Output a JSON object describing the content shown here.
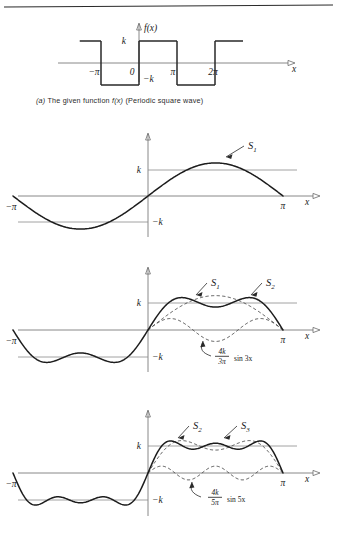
{
  "figure": {
    "background": "#ffffff",
    "ink": "#1a1a1a",
    "top_rule": true
  },
  "caption": {
    "prefix": "(a)",
    "text_before_fx": " The given function ",
    "fx": "f(x)",
    "text_after_fx": " (Periodic square wave)"
  },
  "labels": {
    "x_axis": "x",
    "fx": "f(x)",
    "k": "k",
    "neg_k": "−k",
    "neg_pi": "−π",
    "zero": "0",
    "pi": "π",
    "two_pi": "2π",
    "S1": "S",
    "S1_sub": "1",
    "S2": "S",
    "S2_sub": "2",
    "S3": "S",
    "S3_sub": "3"
  },
  "harmonic_labels": {
    "third": {
      "num": "4k",
      "den": "3π",
      "rest": "sin 3x"
    },
    "fifth": {
      "num": "4k",
      "den": "5π",
      "rest": "sin 5x"
    }
  },
  "chart_data": [
    {
      "id": "panel-a",
      "type": "line",
      "title": "(a) The given function f(x) (Periodic square wave)",
      "xlabel": "x",
      "ylabel": "f(x)",
      "xlim": [
        -4.9,
        8.6
      ],
      "ylim": [
        -1.9,
        1.9
      ],
      "xticks": [
        -3.14159,
        0,
        3.14159,
        6.28319
      ],
      "xticklabels": [
        "−π",
        "0",
        "π",
        "2π"
      ],
      "yticks": [
        1,
        -1
      ],
      "yticklabels": [
        "k",
        "−k"
      ],
      "grid": false,
      "legend": "none",
      "series": [
        {
          "name": "f(x) square wave",
          "style": "solid",
          "description": "Periodic square wave of period 2pi, amplitude k: value -k on (-pi,0), +k on (0,pi), -k on (pi,2pi), +k on (2pi,3pi)",
          "segments": [
            {
              "x": [
                -4.9,
                -3.14159
              ],
              "y": [
                1,
                1
              ]
            },
            {
              "x": [
                -3.14159,
                -3.14159
              ],
              "y": [
                1,
                -1
              ]
            },
            {
              "x": [
                -3.14159,
                0
              ],
              "y": [
                -1,
                -1
              ]
            },
            {
              "x": [
                0,
                0
              ],
              "y": [
                -1,
                1
              ]
            },
            {
              "x": [
                0,
                3.14159
              ],
              "y": [
                1,
                1
              ]
            },
            {
              "x": [
                3.14159,
                3.14159
              ],
              "y": [
                1,
                -1
              ]
            },
            {
              "x": [
                3.14159,
                6.28319
              ],
              "y": [
                -1,
                -1
              ]
            },
            {
              "x": [
                6.28319,
                6.28319
              ],
              "y": [
                -1,
                1
              ]
            },
            {
              "x": [
                6.28319,
                8.6
              ],
              "y": [
                1,
                1
              ]
            }
          ]
        }
      ]
    },
    {
      "id": "panel-b",
      "type": "line",
      "title": "First partial sum S1",
      "xlabel": "x",
      "ylabel": "",
      "xlim": [
        -3.14159,
        3.14159
      ],
      "ylim": [
        -1.55,
        1.55
      ],
      "xticks": [
        -3.14159,
        3.14159
      ],
      "xticklabels": [
        "−π",
        "π"
      ],
      "yticks": [
        1,
        -1
      ],
      "yticklabels": [
        "k",
        "−k"
      ],
      "grid": false,
      "legend": "annotation",
      "annotations": [
        {
          "text": "S1",
          "points_to": "S1 curve near x=1.9"
        }
      ],
      "series": [
        {
          "name": "S1",
          "style": "solid",
          "formula": "(4k/pi) sin x",
          "amplitude": 1.2732,
          "harmonics": [
            {
              "n": 1,
              "coef": 1.2732
            }
          ]
        }
      ]
    },
    {
      "id": "panel-c",
      "type": "line",
      "title": "Partial sums S1 and S2 with third harmonic",
      "xlabel": "x",
      "ylabel": "",
      "xlim": [
        -3.14159,
        3.14159
      ],
      "ylim": [
        -1.55,
        1.55
      ],
      "xticks": [
        -3.14159,
        3.14159
      ],
      "xticklabels": [
        "−π",
        "π"
      ],
      "yticks": [
        1,
        -1
      ],
      "yticklabels": [
        "k",
        "−k"
      ],
      "grid": false,
      "legend": "annotation",
      "annotations": [
        {
          "text": "S1",
          "points_to": "dashed S1 curve"
        },
        {
          "text": "S2",
          "points_to": "solid S2 curve"
        },
        {
          "text": "(4k/3π) sin 3x",
          "points_to": "dashed third-harmonic curve"
        }
      ],
      "series": [
        {
          "name": "S1",
          "style": "dashed",
          "formula": "(4k/pi) sin x",
          "harmonics": [
            {
              "n": 1,
              "coef": 1.2732
            }
          ]
        },
        {
          "name": "S2",
          "style": "solid",
          "formula": "(4k/pi)(sin x + (1/3) sin 3x)",
          "harmonics": [
            {
              "n": 1,
              "coef": 1.2732
            },
            {
              "n": 3,
              "coef": 0.4244
            }
          ]
        },
        {
          "name": "(4k/3π) sin 3x",
          "style": "dashed",
          "formula": "(4k/3pi) sin 3x",
          "harmonics": [
            {
              "n": 3,
              "coef": 0.4244
            }
          ]
        }
      ],
      "left_half_curve": "S2 continued over (-pi, 0)"
    },
    {
      "id": "panel-d",
      "type": "line",
      "title": "Partial sums S2 and S3 with fifth harmonic",
      "xlabel": "x",
      "ylabel": "",
      "xlim": [
        -3.14159,
        3.14159
      ],
      "ylim": [
        -1.55,
        1.55
      ],
      "xticks": [
        -3.14159,
        3.14159
      ],
      "xticklabels": [
        "−π",
        "π"
      ],
      "yticks": [
        1,
        -1
      ],
      "yticklabels": [
        "k",
        "−k"
      ],
      "grid": false,
      "legend": "annotation",
      "annotations": [
        {
          "text": "S2",
          "points_to": "dashed S2 curve"
        },
        {
          "text": "S3",
          "points_to": "solid S3 curve"
        },
        {
          "text": "(4k/5π) sin 5x",
          "points_to": "dashed fifth-harmonic curve"
        }
      ],
      "series": [
        {
          "name": "S2",
          "style": "dashed",
          "formula": "(4k/pi)(sin x + (1/3) sin 3x)",
          "harmonics": [
            {
              "n": 1,
              "coef": 1.2732
            },
            {
              "n": 3,
              "coef": 0.4244
            }
          ]
        },
        {
          "name": "S3",
          "style": "solid",
          "formula": "(4k/pi)(sin x + (1/3) sin 3x + (1/5) sin 5x)",
          "harmonics": [
            {
              "n": 1,
              "coef": 1.2732
            },
            {
              "n": 3,
              "coef": 0.4244
            },
            {
              "n": 5,
              "coef": 0.2546
            }
          ]
        },
        {
          "name": "(4k/5π) sin 5x",
          "style": "dashed",
          "formula": "(4k/5pi) sin 5x",
          "harmonics": [
            {
              "n": 5,
              "coef": 0.2546
            }
          ]
        }
      ],
      "left_half_curve": "S3 continued over (-pi, 0)"
    }
  ]
}
